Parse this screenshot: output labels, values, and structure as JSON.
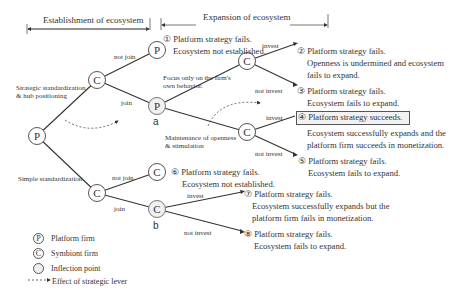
{
  "header": {
    "establishment": "Establishment of ecosystem",
    "expansion": "Expansion of ecosystem"
  },
  "nodes": {
    "root": "P",
    "c_upper": "C",
    "p_notjoin": "P",
    "p_a": "P",
    "c_top_right": "C",
    "c_mid_right": "C",
    "c_lower": "C",
    "c_notjoin_lower": "C",
    "c_b": "C",
    "label_a": "a",
    "label_b": "b"
  },
  "edges": {
    "strategic_std": [
      "Strategic standardization",
      "& hub positioning"
    ],
    "simple_std": "Simple standardization",
    "not_join_upper": "not join",
    "join_upper": "join",
    "focus_only": [
      "Focus only on the firm's",
      "own behavior."
    ],
    "maintenance": [
      "Maintenance of openness",
      "& stimulation"
    ],
    "invest_2": "invest",
    "not_invest_3": "not invest",
    "invest_4": "invest",
    "not_invest_5": "not invest",
    "not_join_lower": "not join",
    "join_lower": "join",
    "invest_7": "invest",
    "not_invest_8": "not invest"
  },
  "outcomes": {
    "o1": [
      "① Platform strategy fails.",
      "Ecosystem not established."
    ],
    "o2": [
      "② Platform strategy fails.",
      "Openness is undermined and ecosystem",
      "fails to expand."
    ],
    "o3": [
      "③ Platform strategy fails.",
      "Ecosystem fails to expand."
    ],
    "o4": [
      "④ Platform strategy succeeds.",
      "Ecosystem successfully expands and the",
      "platform firm succeeds in monetization."
    ],
    "o5": [
      "⑤ Platform strategy fails.",
      "Ecosystem fails to expand."
    ],
    "o6": [
      "⑥ Platform strategy fails.",
      "Ecosystem not established."
    ],
    "o7": [
      "⑦ Platform strategy fails.",
      "Ecosystem successfully expands but the",
      "platform firm fails in monetization."
    ],
    "o8": [
      "⑧ Platform strategy fails.",
      "Ecosystem fails to expand."
    ]
  },
  "legend": {
    "p_symbol": "P",
    "p_label": "Platform firm",
    "c_symbol": "C",
    "c_label": "Symbiont firm",
    "inflection_label": "Inflection point",
    "lever_label": "Effect of strategic lever"
  },
  "colors": {
    "line": "#333333",
    "highlight_box": "#f2f2f2",
    "inflection_fill": "#f0f0f0"
  }
}
